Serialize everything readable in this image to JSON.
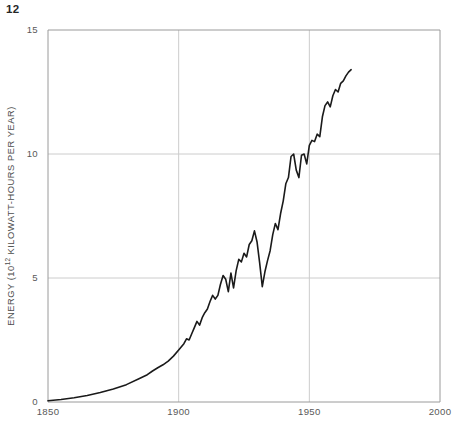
{
  "page": {
    "number": "12"
  },
  "chart_data": {
    "type": "line",
    "title": "",
    "subtitle": "",
    "xlabel": "",
    "ylabel": "ENERGY (10",
    "ylabel_exponent": "12",
    "ylabel_tail": " KILOWATT-HOURS PER YEAR)",
    "ylabel_full": "ENERGY (10¹² KILOWATT-HOURS PER YEAR)",
    "xlim": [
      1850,
      2000
    ],
    "ylim": [
      0,
      15
    ],
    "xticks": [
      1850,
      1900,
      1950,
      2000
    ],
    "xtick_labels": [
      "1850",
      "1900",
      "1950",
      "2000"
    ],
    "yticks": [
      0,
      5,
      10,
      15
    ],
    "ytick_labels": [
      "0",
      "5",
      "10",
      "15"
    ],
    "grid": true,
    "grid_color": "#cccccc",
    "legend": null,
    "line_color": "#1a1a1a",
    "line_width": 1.6,
    "series": [
      {
        "name": "World energy consumption",
        "x": [
          1850,
          1855,
          1860,
          1865,
          1870,
          1875,
          1880,
          1885,
          1888,
          1890,
          1892,
          1894,
          1896,
          1898,
          1900,
          1902,
          1903,
          1904,
          1905,
          1906,
          1907,
          1908,
          1909,
          1910,
          1911,
          1912,
          1913,
          1914,
          1915,
          1916,
          1917,
          1918,
          1919,
          1920,
          1921,
          1922,
          1923,
          1924,
          1925,
          1926,
          1927,
          1928,
          1929,
          1930,
          1931,
          1932,
          1933,
          1934,
          1935,
          1936,
          1937,
          1938,
          1939,
          1940,
          1941,
          1942,
          1943,
          1944,
          1945,
          1946,
          1947,
          1948,
          1949,
          1950,
          1951,
          1952,
          1953,
          1954,
          1955,
          1956,
          1957,
          1958,
          1959,
          1960,
          1961,
          1962,
          1963,
          1964,
          1965,
          1966
        ],
        "y": [
          0.05,
          0.1,
          0.17,
          0.26,
          0.38,
          0.52,
          0.7,
          0.95,
          1.1,
          1.25,
          1.38,
          1.5,
          1.65,
          1.85,
          2.1,
          2.35,
          2.55,
          2.5,
          2.75,
          3.0,
          3.25,
          3.1,
          3.4,
          3.6,
          3.75,
          4.05,
          4.3,
          4.15,
          4.3,
          4.75,
          5.1,
          4.95,
          4.45,
          5.2,
          4.6,
          5.3,
          5.75,
          5.65,
          6.0,
          5.85,
          6.35,
          6.5,
          6.9,
          6.45,
          5.6,
          4.65,
          5.25,
          5.7,
          6.1,
          6.75,
          7.2,
          6.95,
          7.6,
          8.1,
          8.8,
          9.05,
          9.9,
          10.0,
          9.35,
          9.05,
          9.95,
          10.0,
          9.6,
          10.35,
          10.55,
          10.5,
          10.8,
          10.7,
          11.5,
          11.95,
          12.1,
          11.9,
          12.35,
          12.6,
          12.5,
          12.85,
          12.95,
          13.15,
          13.3,
          13.4
        ]
      }
    ],
    "annotations": []
  }
}
